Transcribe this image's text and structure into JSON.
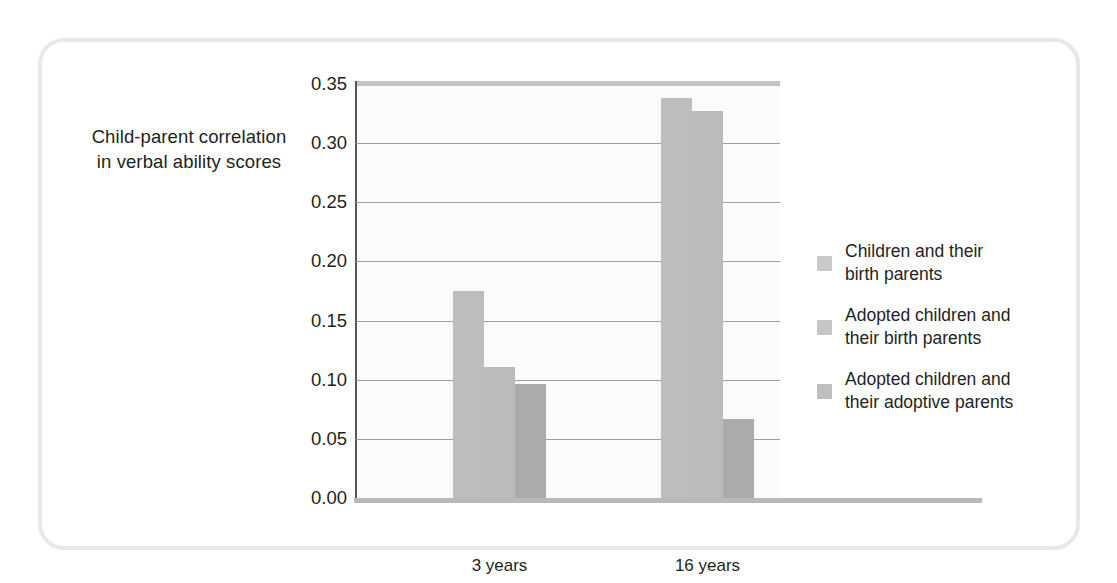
{
  "chart_data": {
    "type": "bar",
    "title": "",
    "subtitle": "",
    "xlabel": "",
    "ylabel": "Child-parent correlation in verbal ability scores",
    "ylabel_line1": "Child-parent correlation",
    "ylabel_line2": "in verbal ability scores",
    "categories": [
      "3 years",
      "16 years"
    ],
    "series": [
      {
        "name": "Children and their birth parents",
        "name_line1": "Children and their",
        "name_line2": "birth parents",
        "color": "#bdbdbd",
        "values": [
          0.175,
          0.338
        ]
      },
      {
        "name": "Adopted children and their birth parents",
        "name_line1": "Adopted children and",
        "name_line2": "their birth parents",
        "color": "#bbbbbb",
        "values": [
          0.111,
          0.327
        ]
      },
      {
        "name": "Adopted children and their adoptive parents",
        "name_line1": "Adopted children and",
        "name_line2": "their adoptive parents",
        "color": "#ababab",
        "values": [
          0.096,
          0.067
        ]
      }
    ],
    "ylim": [
      0.0,
      0.35
    ],
    "ytick_values": [
      0.0,
      0.05,
      0.1,
      0.15,
      0.2,
      0.25,
      0.3,
      0.35
    ],
    "ytick_labels": [
      "0.00",
      "0.05",
      "0.10",
      "0.15",
      "0.20",
      "0.25",
      "0.30",
      "0.35"
    ],
    "grid": true,
    "grid_axis": "y",
    "legend_position": "right",
    "frame_border_color": "#e8e8e8",
    "plot_background": "#fbfbfb",
    "gridline_color": "#9d9d9d",
    "text_color": "#231f20"
  }
}
